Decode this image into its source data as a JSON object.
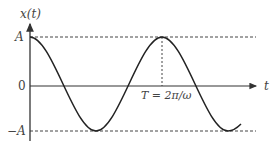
{
  "diagram": {
    "type": "sinusoid-graph",
    "y_axis_label": "x(t)",
    "x_axis_label": "t",
    "ticks": {
      "A": "A",
      "zero": "0",
      "minus_A": "−A"
    },
    "period_label": "T = 2π/ω",
    "curve": "x(t) = A cos(ωt)",
    "colors": {
      "curve": "#222222",
      "axis": "#333333",
      "dashed": "#444444",
      "text": "#444444"
    }
  }
}
